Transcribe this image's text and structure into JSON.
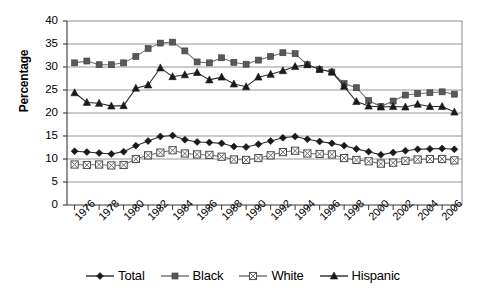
{
  "chart_data": {
    "type": "line",
    "title": "",
    "xlabel": "",
    "ylabel": "Percentage",
    "xlim": [
      1976,
      2007
    ],
    "ylim": [
      0,
      40
    ],
    "ytick_step": 5,
    "yticks": [
      40,
      35,
      30,
      25,
      20,
      15,
      10,
      5,
      0
    ],
    "grid": "horizontal",
    "legend_position": "bottom",
    "x": [
      1976,
      1977,
      1978,
      1979,
      1980,
      1981,
      1982,
      1983,
      1984,
      1985,
      1986,
      1987,
      1988,
      1989,
      1990,
      1991,
      1992,
      1993,
      1994,
      1995,
      1996,
      1997,
      1998,
      1999,
      2000,
      2001,
      2002,
      2003,
      2004,
      2005,
      2006,
      2007
    ],
    "xtick_labels": [
      "1976",
      "1978",
      "1980",
      "1982",
      "1984",
      "1986",
      "1988",
      "1990",
      "1992",
      "1994",
      "1996",
      "1998",
      "2000",
      "2002",
      "2004",
      "2006"
    ],
    "xtick_label_years": [
      1976,
      1978,
      1980,
      1982,
      1984,
      1986,
      1988,
      1990,
      1992,
      1994,
      1996,
      1998,
      2000,
      2002,
      2004,
      2006
    ],
    "series": [
      {
        "name": "Total",
        "marker": "diamond",
        "color": "#1a1a1a",
        "values": [
          11.7,
          11.5,
          11.3,
          11.1,
          11.6,
          12.9,
          13.9,
          14.9,
          15.1,
          14.2,
          13.7,
          13.6,
          13.4,
          12.7,
          12.6,
          13.2,
          13.9,
          14.6,
          14.9,
          14.3,
          13.8,
          13.4,
          12.9,
          12.2,
          11.6,
          10.9,
          11.4,
          11.8,
          12.1,
          12.2,
          12.3,
          12.1
        ]
      },
      {
        "name": "Black",
        "marker": "square",
        "color": "#58595b",
        "values": [
          30.9,
          31.3,
          30.5,
          30.5,
          30.9,
          32.3,
          34.0,
          35.2,
          35.4,
          33.5,
          31.1,
          30.9,
          32.0,
          31.0,
          30.6,
          31.5,
          32.3,
          33.1,
          32.9,
          30.5,
          29.5,
          28.9,
          26.4,
          25.5,
          22.7,
          21.4,
          22.6,
          23.9,
          24.2,
          24.4,
          24.6,
          24.1
        ]
      },
      {
        "name": "White",
        "marker": "square-x",
        "color": "#58595b",
        "values": [
          8.8,
          8.7,
          8.8,
          8.6,
          8.7,
          10.0,
          10.8,
          11.4,
          11.9,
          11.2,
          11.0,
          10.9,
          10.5,
          9.9,
          9.8,
          10.2,
          10.8,
          11.5,
          11.8,
          11.2,
          11.1,
          11.0,
          10.2,
          9.8,
          9.5,
          9.0,
          9.2,
          9.6,
          9.9,
          10.0,
          10.0,
          9.7
        ]
      },
      {
        "name": "Hispanic",
        "marker": "triangle",
        "color": "#1a1a1a",
        "values": [
          24.4,
          22.3,
          22.1,
          21.5,
          21.6,
          25.4,
          26.1,
          29.8,
          27.9,
          28.3,
          28.8,
          27.2,
          27.8,
          26.3,
          25.7,
          27.8,
          28.4,
          29.2,
          30.1,
          30.5,
          29.5,
          28.9,
          25.8,
          22.5,
          21.5,
          21.3,
          21.4,
          21.3,
          21.9,
          21.4,
          21.4,
          20.2
        ]
      }
    ]
  },
  "axis": {
    "ylabel": "Percentage"
  }
}
